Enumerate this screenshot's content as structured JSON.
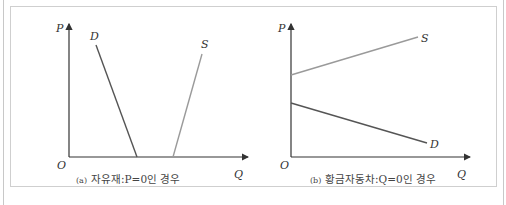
{
  "figure": {
    "panels": [
      {
        "id": "a",
        "caption_prefix": "(a)",
        "caption_text": "자유재:P=0인 경우",
        "axes": {
          "y_label": "P",
          "x_label": "Q",
          "origin_label": "O"
        },
        "curves": [
          {
            "name": "D",
            "label": "D",
            "color": "#555555"
          },
          {
            "name": "S",
            "label": "S",
            "color": "#9a9a9a"
          }
        ]
      },
      {
        "id": "b",
        "caption_prefix": "(b)",
        "caption_text": "황금자동차:Q=0인 경우",
        "axes": {
          "y_label": "P",
          "x_label": "Q",
          "origin_label": "O"
        },
        "curves": [
          {
            "name": "S",
            "label": "S",
            "color": "#9a9a9a"
          },
          {
            "name": "D",
            "label": "D",
            "color": "#555555"
          }
        ]
      }
    ],
    "colors": {
      "axis": "#333333",
      "frame": "#cfcfcf",
      "demand": "#555555",
      "supply": "#9a9a9a"
    }
  }
}
